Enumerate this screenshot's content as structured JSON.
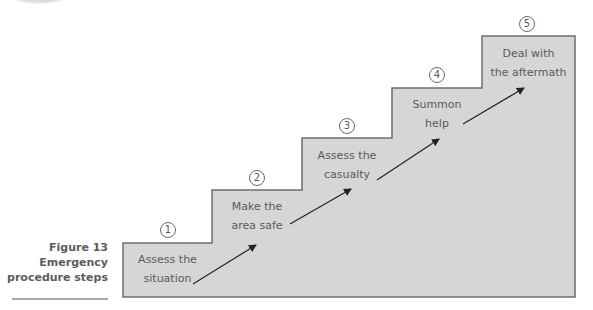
{
  "figure": {
    "number_label": "Figure 13",
    "title_lines": [
      "Emergency",
      "procedure steps"
    ]
  },
  "colors": {
    "step_fill": "#d6d6d6",
    "step_stroke": "#6e6e6e",
    "text": "#5a5a5a",
    "arrow": "#222222"
  },
  "steps": [
    {
      "number": "1",
      "line1": "Assess the",
      "line2": "situation"
    },
    {
      "number": "2",
      "line1": "Make the",
      "line2": "area safe"
    },
    {
      "number": "3",
      "line1": "Assess the",
      "line2": "casualty"
    },
    {
      "number": "4",
      "line1": "Summon",
      "line2": "help"
    },
    {
      "number": "5",
      "line1": "Deal with",
      "line2": "the aftermath"
    }
  ]
}
